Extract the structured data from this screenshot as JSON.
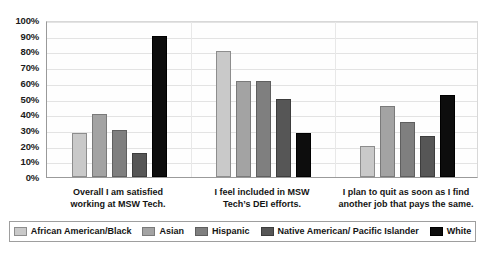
{
  "chart_data": {
    "type": "bar",
    "title": "",
    "xlabel": "",
    "ylabel": "",
    "ylim": [
      0,
      100
    ],
    "grid": true,
    "legend_position": "bottom",
    "y_ticks": [
      "0%",
      "10%",
      "20%",
      "30%",
      "40%",
      "50%",
      "60%",
      "70%",
      "80%",
      "90%",
      "100%"
    ],
    "categories": [
      "Overall I am satisfied working at MSW Tech.",
      "I feel included in MSW Tech’s DEI efforts.",
      "I plan to quit as soon as I find another job that pays the same."
    ],
    "category_lines": [
      [
        "Overall I am satisfied",
        "working at MSW Tech."
      ],
      [
        "I feel included in MSW",
        "Tech’s DEI efforts."
      ],
      [
        "I plan to quit as soon as I find",
        "another job that pays the same."
      ]
    ],
    "series": [
      {
        "name": "African American/Black",
        "color": "#c9c9c9",
        "values": [
          28,
          80,
          20
        ]
      },
      {
        "name": "Asian",
        "color": "#a3a3a3",
        "values": [
          40,
          61,
          45
        ]
      },
      {
        "name": "Hispanic",
        "color": "#7f7f7f",
        "values": [
          30,
          61,
          35
        ]
      },
      {
        "name": "Native American/ Pacific Islander",
        "color": "#565656",
        "values": [
          15,
          50,
          26
        ]
      },
      {
        "name": "White",
        "color": "#0d0d0d",
        "values": [
          90,
          28,
          52
        ]
      }
    ]
  }
}
